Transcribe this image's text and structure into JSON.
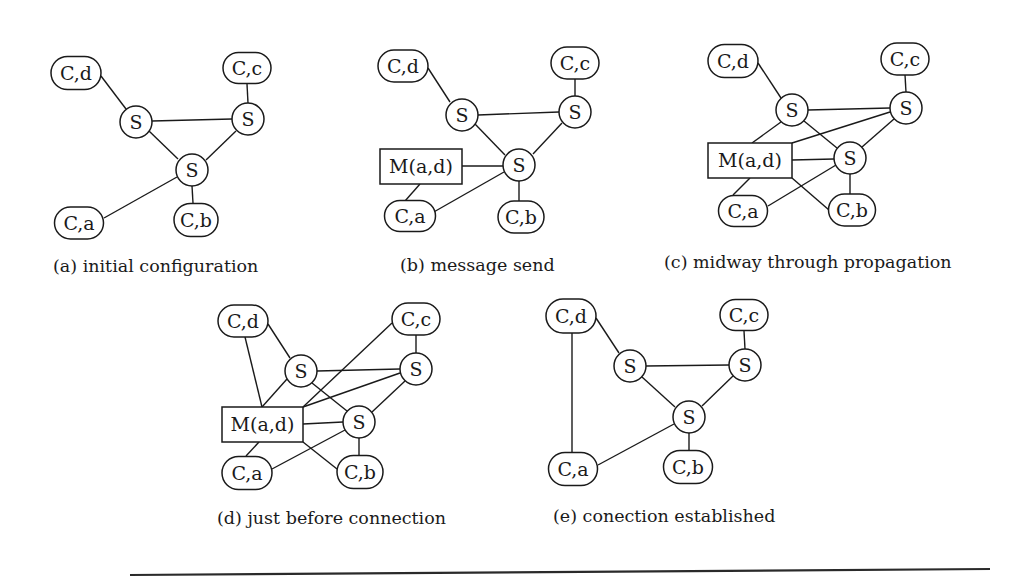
{
  "figure": {
    "panels": [
      {
        "id": "a",
        "caption": "(a) initial configuration",
        "caption_pos": [
          53,
          272
        ],
        "nodes": [
          {
            "id": "cd",
            "type": "client",
            "label": "C,d",
            "cx": 76,
            "cy": 73,
            "w": 50,
            "h": 33
          },
          {
            "id": "cc",
            "type": "client",
            "label": "C,c",
            "cx": 247,
            "cy": 68,
            "w": 48,
            "h": 31
          },
          {
            "id": "s1",
            "type": "server",
            "label": "S",
            "cx": 136,
            "cy": 122,
            "r": 16
          },
          {
            "id": "s2",
            "type": "server",
            "label": "S",
            "cx": 248,
            "cy": 119,
            "r": 16
          },
          {
            "id": "s3",
            "type": "server",
            "label": "S",
            "cx": 192,
            "cy": 170,
            "r": 16
          },
          {
            "id": "ca",
            "type": "client",
            "label": "C,a",
            "cx": 79,
            "cy": 223,
            "w": 49,
            "h": 32
          },
          {
            "id": "cb",
            "type": "client",
            "label": "C,b",
            "cx": 196,
            "cy": 220,
            "w": 44,
            "h": 33
          }
        ],
        "edges": [
          [
            101,
            76,
            126,
            109
          ],
          [
            247,
            84,
            248,
            103
          ],
          [
            152,
            121,
            232,
            119
          ],
          [
            149,
            131,
            178,
            159
          ],
          [
            236,
            131,
            206,
            160
          ],
          [
            177,
            177,
            104,
            218
          ],
          [
            192,
            186,
            193,
            203
          ]
        ]
      },
      {
        "id": "b",
        "caption": "(b) message send",
        "caption_pos": [
          400,
          271
        ],
        "nodes": [
          {
            "id": "cd",
            "type": "client",
            "label": "C,d",
            "cx": 403,
            "cy": 66,
            "w": 50,
            "h": 32
          },
          {
            "id": "cc",
            "type": "client",
            "label": "C,c",
            "cx": 575,
            "cy": 63,
            "w": 48,
            "h": 32
          },
          {
            "id": "s1",
            "type": "server",
            "label": "S",
            "cx": 462,
            "cy": 115,
            "r": 16
          },
          {
            "id": "s2",
            "type": "server",
            "label": "S",
            "cx": 575,
            "cy": 112,
            "r": 16
          },
          {
            "id": "s3",
            "type": "server",
            "label": "S",
            "cx": 519,
            "cy": 165,
            "r": 16
          },
          {
            "id": "m",
            "type": "message",
            "label": "M(a,d)",
            "x": 380,
            "y": 149,
            "w": 82,
            "h": 35
          },
          {
            "id": "ca",
            "type": "client",
            "label": "C,a",
            "cx": 410,
            "cy": 216,
            "w": 51,
            "h": 31
          },
          {
            "id": "cb",
            "type": "client",
            "label": "C,b",
            "cx": 521,
            "cy": 217,
            "w": 46,
            "h": 32
          }
        ],
        "edges": [
          [
            428,
            68,
            450,
            102
          ],
          [
            575,
            79,
            575,
            96
          ],
          [
            478,
            115,
            559,
            112
          ],
          [
            475,
            124,
            505,
            155
          ],
          [
            562,
            123,
            533,
            154
          ],
          [
            462,
            166,
            503,
            166
          ],
          [
            420,
            184,
            405,
            201
          ],
          [
            504,
            172,
            432,
            213
          ],
          [
            519,
            181,
            519,
            201
          ]
        ]
      },
      {
        "id": "c",
        "caption": "(c) midway through propagation",
        "caption_pos": [
          664,
          268
        ],
        "nodes": [
          {
            "id": "cd",
            "type": "client",
            "label": "C,d",
            "cx": 733,
            "cy": 61,
            "w": 50,
            "h": 33
          },
          {
            "id": "cc",
            "type": "client",
            "label": "C,c",
            "cx": 905,
            "cy": 59,
            "w": 48,
            "h": 32
          },
          {
            "id": "s1",
            "type": "server",
            "label": "S",
            "cx": 792,
            "cy": 110,
            "r": 16
          },
          {
            "id": "s2",
            "type": "server",
            "label": "S",
            "cx": 906,
            "cy": 108,
            "r": 16
          },
          {
            "id": "s3",
            "type": "server",
            "label": "S",
            "cx": 850,
            "cy": 158,
            "r": 16
          },
          {
            "id": "m",
            "type": "message",
            "label": "M(a,d)",
            "x": 708,
            "y": 143,
            "w": 84,
            "h": 35
          },
          {
            "id": "ca",
            "type": "client",
            "label": "C,a",
            "cx": 743,
            "cy": 211,
            "w": 49,
            "h": 31
          },
          {
            "id": "cb",
            "type": "client",
            "label": "C,b",
            "cx": 852,
            "cy": 210,
            "w": 47,
            "h": 32
          }
        ],
        "edges": [
          [
            758,
            63,
            781,
            98
          ],
          [
            905,
            75,
            906,
            92
          ],
          [
            808,
            110,
            890,
            108
          ],
          [
            781,
            122,
            752,
            143
          ],
          [
            890,
            112,
            792,
            143
          ],
          [
            804,
            121,
            837,
            148
          ],
          [
            894,
            119,
            862,
            147
          ],
          [
            792,
            160,
            834,
            159
          ],
          [
            750,
            178,
            733,
            195
          ],
          [
            836,
            165,
            768,
            206
          ],
          [
            792,
            178,
            829,
            210
          ],
          [
            850,
            174,
            850,
            194
          ]
        ]
      },
      {
        "id": "d",
        "caption": "(d) just before connection",
        "caption_pos": [
          217,
          524
        ],
        "nodes": [
          {
            "id": "cd",
            "type": "client",
            "label": "C,d",
            "cx": 243,
            "cy": 321,
            "w": 50,
            "h": 32
          },
          {
            "id": "cc",
            "type": "client",
            "label": "C,c",
            "cx": 416,
            "cy": 319,
            "w": 48,
            "h": 32
          },
          {
            "id": "s1",
            "type": "server",
            "label": "S",
            "cx": 301,
            "cy": 371,
            "r": 16
          },
          {
            "id": "s2",
            "type": "server",
            "label": "S",
            "cx": 416,
            "cy": 369,
            "r": 16
          },
          {
            "id": "s3",
            "type": "server",
            "label": "S",
            "cx": 359,
            "cy": 422,
            "r": 16
          },
          {
            "id": "m",
            "type": "message",
            "label": "M(a,d)",
            "x": 222,
            "y": 407,
            "w": 81,
            "h": 35
          },
          {
            "id": "ca",
            "type": "client",
            "label": "C,a",
            "cx": 247,
            "cy": 473,
            "w": 50,
            "h": 33
          },
          {
            "id": "cb",
            "type": "client",
            "label": "C,b",
            "cx": 360,
            "cy": 472,
            "w": 46,
            "h": 33
          }
        ],
        "edges": [
          [
            268,
            324,
            290,
            358
          ],
          [
            245,
            337,
            262,
            407
          ],
          [
            416,
            335,
            416,
            353
          ],
          [
            392,
            323,
            303,
            407
          ],
          [
            317,
            371,
            400,
            369
          ],
          [
            287,
            379,
            262,
            407
          ],
          [
            400,
            373,
            303,
            407
          ],
          [
            312,
            383,
            347,
            411
          ],
          [
            405,
            381,
            372,
            412
          ],
          [
            303,
            424,
            343,
            422
          ],
          [
            259,
            442,
            246,
            456
          ],
          [
            345,
            430,
            272,
            469
          ],
          [
            303,
            442,
            337,
            469
          ],
          [
            359,
            438,
            359,
            455
          ]
        ]
      },
      {
        "id": "e",
        "caption": "(e) conection established",
        "caption_pos": [
          553,
          522
        ],
        "nodes": [
          {
            "id": "cd",
            "type": "client",
            "label": "C,d",
            "cx": 571,
            "cy": 316,
            "w": 50,
            "h": 34
          },
          {
            "id": "cc",
            "type": "client",
            "label": "C,c",
            "cx": 744,
            "cy": 315,
            "w": 48,
            "h": 31
          },
          {
            "id": "s1",
            "type": "server",
            "label": "S",
            "cx": 630,
            "cy": 366,
            "r": 16
          },
          {
            "id": "s2",
            "type": "server",
            "label": "S",
            "cx": 745,
            "cy": 365,
            "r": 16
          },
          {
            "id": "s3",
            "type": "server",
            "label": "S",
            "cx": 689,
            "cy": 417,
            "r": 16
          },
          {
            "id": "ca",
            "type": "client",
            "label": "C,a",
            "cx": 573,
            "cy": 469,
            "w": 49,
            "h": 33
          },
          {
            "id": "cb",
            "type": "client",
            "label": "C,b",
            "cx": 688,
            "cy": 467,
            "w": 49,
            "h": 33
          }
        ],
        "edges": [
          [
            596,
            318,
            619,
            353
          ],
          [
            572,
            333,
            572,
            452
          ],
          [
            744,
            331,
            745,
            349
          ],
          [
            646,
            366,
            729,
            365
          ],
          [
            642,
            377,
            675,
            407
          ],
          [
            733,
            376,
            702,
            406
          ],
          [
            674,
            424,
            598,
            465
          ],
          [
            689,
            433,
            689,
            450
          ]
        ]
      }
    ],
    "rule": {
      "x1": 130,
      "y1": 575,
      "x2": 990,
      "y2": 569
    }
  }
}
